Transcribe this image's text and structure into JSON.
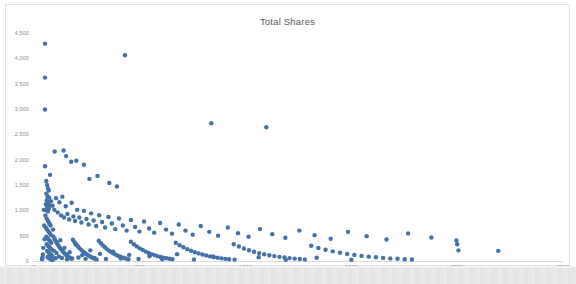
{
  "chart_data": {
    "type": "scatter",
    "title": "Total Shares",
    "xlabel": "",
    "ylabel": "",
    "xlim": [
      0,
      2500
    ],
    "ylim": [
      0,
      4500
    ],
    "grid": false,
    "legend": false,
    "marker_color": "#4472a8",
    "marker_size": 2.2,
    "x_ticks": [
      "0",
      "500",
      "1000",
      "1500",
      "2000",
      "2500"
    ],
    "x_tick_values": [
      0,
      500,
      1000,
      1500,
      2000,
      2500
    ],
    "y_ticks": [
      "0",
      "500",
      "1,000",
      "1,500",
      "2,000",
      "2,500",
      "3,000",
      "3,500",
      "4,000",
      "4,500"
    ],
    "y_tick_values": [
      0,
      500,
      1000,
      1500,
      2000,
      2500,
      3000,
      3500,
      4000,
      4500
    ],
    "series": [
      {
        "name": "Total Shares",
        "points": [
          [
            52,
            4290
          ],
          [
            52,
            3620
          ],
          [
            52,
            2990
          ],
          [
            430,
            4060
          ],
          [
            838,
            2720
          ],
          [
            1098,
            2640
          ],
          [
            98,
            2160
          ],
          [
            140,
            2180
          ],
          [
            152,
            2070
          ],
          [
            176,
            1960
          ],
          [
            52,
            1870
          ],
          [
            76,
            1700
          ],
          [
            200,
            1980
          ],
          [
            236,
            1900
          ],
          [
            262,
            1620
          ],
          [
            300,
            1680
          ],
          [
            356,
            1540
          ],
          [
            392,
            1470
          ],
          [
            58,
            1580
          ],
          [
            62,
            1500
          ],
          [
            66,
            1430
          ],
          [
            70,
            1390
          ],
          [
            58,
            1330
          ],
          [
            64,
            1280
          ],
          [
            72,
            1245
          ],
          [
            60,
            1200
          ],
          [
            68,
            1160
          ],
          [
            56,
            1120
          ],
          [
            74,
            1095
          ],
          [
            62,
            1060
          ],
          [
            70,
            1030
          ],
          [
            58,
            1000
          ],
          [
            66,
            975
          ],
          [
            80,
            1180
          ],
          [
            88,
            1090
          ],
          [
            96,
            1010
          ],
          [
            104,
            1240
          ],
          [
            112,
            960
          ],
          [
            120,
            1160
          ],
          [
            128,
            900
          ],
          [
            134,
            1270
          ],
          [
            142,
            860
          ],
          [
            150,
            1080
          ],
          [
            158,
            930
          ],
          [
            166,
            820
          ],
          [
            178,
            1150
          ],
          [
            186,
            880
          ],
          [
            194,
            790
          ],
          [
            204,
            1010
          ],
          [
            214,
            860
          ],
          [
            224,
            760
          ],
          [
            236,
            990
          ],
          [
            248,
            830
          ],
          [
            258,
            720
          ],
          [
            270,
            940
          ],
          [
            282,
            800
          ],
          [
            294,
            690
          ],
          [
            308,
            905
          ],
          [
            322,
            770
          ],
          [
            336,
            660
          ],
          [
            352,
            870
          ],
          [
            368,
            740
          ],
          [
            384,
            630
          ],
          [
            402,
            840
          ],
          [
            420,
            700
          ],
          [
            438,
            600
          ],
          [
            458,
            810
          ],
          [
            478,
            670
          ],
          [
            498,
            580
          ],
          [
            520,
            780
          ],
          [
            544,
            640
          ],
          [
            568,
            560
          ],
          [
            596,
            750
          ],
          [
            624,
            620
          ],
          [
            652,
            540
          ],
          [
            684,
            720
          ],
          [
            716,
            600
          ],
          [
            750,
            520
          ],
          [
            788,
            690
          ],
          [
            828,
            575
          ],
          [
            870,
            500
          ],
          [
            916,
            660
          ],
          [
            964,
            550
          ],
          [
            1014,
            480
          ],
          [
            1068,
            630
          ],
          [
            1126,
            530
          ],
          [
            1188,
            460
          ],
          [
            1254,
            600
          ],
          [
            1326,
            510
          ],
          [
            1402,
            440
          ],
          [
            1484,
            575
          ],
          [
            1572,
            490
          ],
          [
            1666,
            425
          ],
          [
            1768,
            545
          ],
          [
            1878,
            465
          ],
          [
            1996,
            405
          ],
          [
            2000,
            330
          ],
          [
            2006,
            210
          ],
          [
            2194,
            200
          ],
          [
            54,
            900
          ],
          [
            60,
            840
          ],
          [
            66,
            790
          ],
          [
            72,
            745
          ],
          [
            78,
            700
          ],
          [
            56,
            660
          ],
          [
            62,
            620
          ],
          [
            68,
            585
          ],
          [
            74,
            550
          ],
          [
            80,
            515
          ],
          [
            58,
            480
          ],
          [
            64,
            450
          ],
          [
            70,
            420
          ],
          [
            76,
            390
          ],
          [
            82,
            360
          ],
          [
            60,
            330
          ],
          [
            66,
            300
          ],
          [
            72,
            275
          ],
          [
            78,
            250
          ],
          [
            84,
            225
          ],
          [
            62,
            200
          ],
          [
            68,
            175
          ],
          [
            74,
            150
          ],
          [
            80,
            125
          ],
          [
            86,
            100
          ],
          [
            64,
            80
          ],
          [
            70,
            60
          ],
          [
            76,
            45
          ],
          [
            82,
            30
          ],
          [
            88,
            20
          ],
          [
            92,
            480
          ],
          [
            98,
            430
          ],
          [
            104,
            380
          ],
          [
            110,
            340
          ],
          [
            116,
            300
          ],
          [
            122,
            265
          ],
          [
            128,
            230
          ],
          [
            134,
            200
          ],
          [
            140,
            170
          ],
          [
            146,
            145
          ],
          [
            152,
            120
          ],
          [
            158,
            100
          ],
          [
            164,
            80
          ],
          [
            170,
            62
          ],
          [
            176,
            46
          ],
          [
            184,
            420
          ],
          [
            192,
            370
          ],
          [
            200,
            325
          ],
          [
            208,
            285
          ],
          [
            216,
            250
          ],
          [
            224,
            215
          ],
          [
            232,
            185
          ],
          [
            240,
            160
          ],
          [
            248,
            135
          ],
          [
            256,
            112
          ],
          [
            264,
            92
          ],
          [
            272,
            74
          ],
          [
            280,
            58
          ],
          [
            288,
            44
          ],
          [
            296,
            32
          ],
          [
            306,
            400
          ],
          [
            316,
            350
          ],
          [
            326,
            305
          ],
          [
            336,
            265
          ],
          [
            346,
            230
          ],
          [
            356,
            200
          ],
          [
            366,
            172
          ],
          [
            376,
            148
          ],
          [
            386,
            126
          ],
          [
            396,
            106
          ],
          [
            406,
            88
          ],
          [
            416,
            72
          ],
          [
            426,
            58
          ],
          [
            436,
            46
          ],
          [
            446,
            36
          ],
          [
            458,
            380
          ],
          [
            472,
            330
          ],
          [
            486,
            288
          ],
          [
            500,
            250
          ],
          [
            514,
            216
          ],
          [
            528,
            186
          ],
          [
            542,
            160
          ],
          [
            556,
            136
          ],
          [
            570,
            115
          ],
          [
            584,
            96
          ],
          [
            598,
            80
          ],
          [
            612,
            66
          ],
          [
            626,
            54
          ],
          [
            640,
            44
          ],
          [
            654,
            35
          ],
          [
            670,
            360
          ],
          [
            688,
            312
          ],
          [
            706,
            270
          ],
          [
            724,
            234
          ],
          [
            742,
            202
          ],
          [
            760,
            174
          ],
          [
            778,
            150
          ],
          [
            796,
            128
          ],
          [
            814,
            108
          ],
          [
            832,
            91
          ],
          [
            850,
            76
          ],
          [
            868,
            63
          ],
          [
            886,
            52
          ],
          [
            904,
            42
          ],
          [
            922,
            34
          ],
          [
            944,
            330
          ],
          [
            968,
            285
          ],
          [
            992,
            246
          ],
          [
            1016,
            212
          ],
          [
            1040,
            182
          ],
          [
            1064,
            156
          ],
          [
            1088,
            134
          ],
          [
            1112,
            114
          ],
          [
            1136,
            97
          ],
          [
            1160,
            82
          ],
          [
            1184,
            69
          ],
          [
            1208,
            57
          ],
          [
            1232,
            47
          ],
          [
            1256,
            38
          ],
          [
            1280,
            31
          ],
          [
            1310,
            300
          ],
          [
            1344,
            258
          ],
          [
            1378,
            222
          ],
          [
            1412,
            190
          ],
          [
            1446,
            163
          ],
          [
            1480,
            139
          ],
          [
            1514,
            119
          ],
          [
            1548,
            101
          ],
          [
            1582,
            86
          ],
          [
            1616,
            73
          ],
          [
            1650,
            61
          ],
          [
            1684,
            51
          ],
          [
            1718,
            43
          ],
          [
            1752,
            36
          ],
          [
            1786,
            30
          ],
          [
            46,
            1010
          ],
          [
            48,
            700
          ],
          [
            50,
            430
          ],
          [
            44,
            260
          ],
          [
            42,
            130
          ],
          [
            40,
            70
          ],
          [
            38,
            35
          ],
          [
            90,
            620
          ],
          [
            94,
            200
          ],
          [
            102,
            55
          ],
          [
            106,
            160
          ],
          [
            118,
            90
          ],
          [
            124,
            410
          ],
          [
            132,
            58
          ],
          [
            144,
            260
          ],
          [
            156,
            36
          ],
          [
            168,
            175
          ],
          [
            180,
            48
          ],
          [
            196,
            330
          ],
          [
            210,
            70
          ],
          [
            228,
            115
          ],
          [
            244,
            42
          ],
          [
            266,
            210
          ],
          [
            286,
            62
          ],
          [
            312,
            140
          ],
          [
            340,
            40
          ],
          [
            374,
            185
          ],
          [
            410,
            50
          ],
          [
            450,
            120
          ],
          [
            494,
            38
          ],
          [
            546,
            95
          ],
          [
            606,
            34
          ],
          [
            676,
            135
          ],
          [
            756,
            30
          ],
          [
            846,
            88
          ],
          [
            948,
            28
          ],
          [
            1062,
            75
          ],
          [
            1190,
            26
          ],
          [
            1336,
            64
          ],
          [
            1500,
            24
          ]
        ]
      }
    ]
  },
  "chart": {
    "title": "Total Shares"
  }
}
